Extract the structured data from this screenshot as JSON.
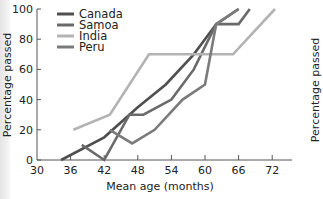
{
  "chart_data": {
    "type": "line",
    "title": "",
    "xlabel": "Mean age (months)",
    "ylabel": "Percentage passed",
    "ylabel_right": "Percentage passed",
    "xlim": [
      30,
      75
    ],
    "ylim": [
      0,
      100
    ],
    "xticks": [
      30,
      36,
      42,
      48,
      54,
      60,
      66,
      72
    ],
    "yticks": [
      0,
      20,
      40,
      60,
      80,
      100
    ],
    "grid": false,
    "legend_position": "upper-left",
    "series": [
      {
        "name": "Canada",
        "color": "#4f4f4f",
        "points": [
          [
            34.3,
            0
          ],
          [
            42,
            15
          ],
          [
            48,
            35
          ],
          [
            53,
            50
          ],
          [
            58,
            70
          ],
          [
            62,
            90
          ],
          [
            66,
            100
          ]
        ]
      },
      {
        "name": "Samoa",
        "color": "#6a6a6a",
        "points": [
          [
            38,
            10
          ],
          [
            42,
            0
          ],
          [
            46.5,
            30
          ],
          [
            49,
            30
          ],
          [
            54,
            40
          ],
          [
            58,
            60
          ],
          [
            62,
            90
          ],
          [
            66,
            90
          ],
          [
            68,
            100
          ]
        ]
      },
      {
        "name": "India",
        "color": "#b3b3b3",
        "points": [
          [
            36.5,
            20
          ],
          [
            43,
            30
          ],
          [
            50,
            70
          ],
          [
            65,
            70
          ],
          [
            72.5,
            100
          ]
        ]
      },
      {
        "name": "Peru",
        "color": "#7b7b7b",
        "points": [
          [
            43,
            20
          ],
          [
            47,
            11
          ],
          [
            51,
            20
          ],
          [
            56,
            40
          ],
          [
            60,
            50
          ],
          [
            62,
            90
          ],
          [
            66,
            100
          ]
        ]
      }
    ]
  },
  "axes": {
    "y_ticks": [
      "0",
      "20",
      "40",
      "60",
      "80",
      "100"
    ],
    "x_ticks": [
      "30",
      "36",
      "42",
      "48",
      "54",
      "60",
      "66",
      "72"
    ],
    "xlabel": "Mean age (months)",
    "ylabel": "Percentage passed",
    "ylabel_right": "Percentage passed"
  },
  "legend": {
    "items": [
      {
        "label": "Canada",
        "color": "#4f4f4f"
      },
      {
        "label": "Samoa",
        "color": "#6a6a6a"
      },
      {
        "label": "India",
        "color": "#b3b3b3"
      },
      {
        "label": "Peru",
        "color": "#7b7b7b"
      }
    ]
  }
}
